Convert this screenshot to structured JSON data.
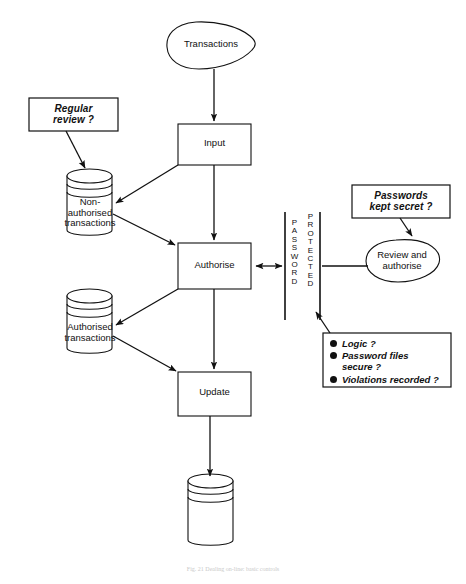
{
  "figure": {
    "caption": "Fig. 21  Dealing on-line: basic controls"
  },
  "nodes": {
    "transactions": {
      "label": "Transactions",
      "shape": "input-blob"
    },
    "input": {
      "label": "Input",
      "shape": "process-box"
    },
    "authorise": {
      "label": "Authorise",
      "shape": "process-box"
    },
    "update": {
      "label": "Update",
      "shape": "process-box"
    },
    "non_authorised_store": {
      "label": "Non-\nauthorised\ntransactions",
      "shape": "cylinder"
    },
    "authorised_store": {
      "label": "Authorised\ntransactions",
      "shape": "cylinder"
    },
    "master_store": {
      "label": "",
      "shape": "cylinder"
    },
    "review_authorise": {
      "label": "Review and\nauthorise",
      "shape": "input-blob"
    }
  },
  "barrier": {
    "password_letters": [
      "P",
      "A",
      "S",
      "S",
      "W",
      "O",
      "R",
      "D"
    ],
    "protected_letters": [
      "P",
      "R",
      "O",
      "T",
      "E",
      "C",
      "T",
      "E",
      "D"
    ],
    "password_text": "PASSWORD",
    "protected_text": "PROTECTED"
  },
  "callouts": {
    "regular_review": {
      "text": "Regular\nreview ?"
    },
    "passwords_secret": {
      "text": "Passwords\nkept secret ?"
    },
    "checks": {
      "items": [
        "Logic ?",
        "Password files\nsecure ?",
        "Violations recorded ?"
      ]
    }
  },
  "colors": {
    "stroke": "#111111",
    "background": "#ffffff",
    "caption": "#c9c9c9"
  }
}
